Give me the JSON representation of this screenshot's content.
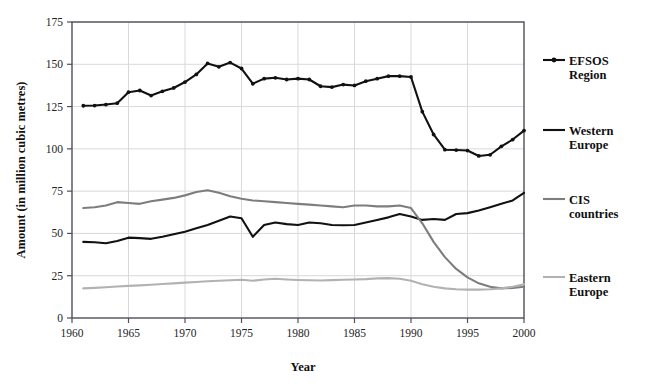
{
  "chart_data": {
    "type": "line",
    "title": "",
    "xlabel": "Year",
    "ylabel": "Amount (in million cubic metres)",
    "xlim": [
      1960,
      2000
    ],
    "ylim": [
      0,
      175
    ],
    "ytick_step": 25,
    "xtick_step": 5,
    "grid": true,
    "grid_axes": "both",
    "legend_position": "right",
    "xticks": [
      1960,
      1965,
      1970,
      1975,
      1980,
      1985,
      1990,
      1995,
      2000
    ],
    "yticks": [
      0,
      25,
      50,
      75,
      100,
      125,
      150,
      175
    ],
    "xtick_labels": [
      "1960",
      "1965",
      "1970",
      "1975",
      "1980",
      "1985",
      "1990",
      "1995",
      "2000"
    ],
    "ytick_labels": [
      "0",
      "25",
      "50",
      "75",
      "100",
      "125",
      "150",
      "175"
    ],
    "x": [
      1961,
      1962,
      1963,
      1964,
      1965,
      1966,
      1967,
      1968,
      1969,
      1970,
      1971,
      1972,
      1973,
      1974,
      1975,
      1976,
      1977,
      1978,
      1979,
      1980,
      1981,
      1982,
      1983,
      1984,
      1985,
      1986,
      1987,
      1988,
      1989,
      1990,
      1991,
      1992,
      1993,
      1994,
      1995,
      1996,
      1997,
      1998,
      1999,
      2000
    ],
    "series": [
      {
        "name": "EFSOS Region",
        "color": "#111111",
        "width": 2.1,
        "markers": true,
        "values": [
          125.5,
          125.6,
          126.2,
          127.0,
          133.5,
          134.5,
          131.5,
          134.0,
          136.0,
          139.5,
          144.0,
          150.5,
          148.5,
          151.0,
          147.5,
          138.5,
          141.5,
          142.0,
          141.0,
          141.5,
          141.0,
          137.0,
          136.5,
          138.0,
          137.5,
          140.0,
          141.5,
          143.0,
          143.0,
          142.5,
          122.0,
          108.5,
          99.5,
          99.3,
          99.0,
          95.8,
          96.5,
          101.5,
          105.5,
          110.8
        ]
      },
      {
        "name": "Western Europe",
        "color": "#111111",
        "width": 2.1,
        "markers": false,
        "values": [
          45.0,
          44.8,
          44.2,
          45.5,
          47.5,
          47.2,
          46.8,
          48.0,
          49.5,
          51.0,
          53.0,
          55.0,
          57.5,
          60.0,
          59.0,
          48.0,
          55.0,
          56.5,
          55.5,
          55.0,
          56.5,
          56.0,
          55.0,
          54.8,
          55.0,
          56.5,
          58.0,
          59.5,
          61.5,
          60.0,
          58.0,
          58.5,
          58.0,
          61.5,
          62.0,
          63.5,
          65.5,
          67.5,
          69.5,
          74.0
        ]
      },
      {
        "name": "CIS countries",
        "color": "#7d7d7d",
        "width": 2.1,
        "markers": false,
        "values": [
          65.0,
          65.5,
          66.5,
          68.5,
          68.0,
          67.5,
          69.0,
          70.0,
          71.0,
          72.5,
          74.5,
          75.5,
          74.0,
          72.0,
          70.5,
          69.5,
          69.0,
          68.5,
          68.0,
          67.5,
          67.0,
          66.5,
          66.0,
          65.5,
          66.5,
          66.5,
          66.0,
          66.0,
          66.5,
          65.0,
          56.0,
          45.0,
          36.0,
          29.0,
          24.0,
          20.5,
          18.5,
          17.5,
          17.8,
          18.5
        ]
      },
      {
        "name": "Eastern Europe",
        "color": "#b2b2b2",
        "width": 2.1,
        "markers": false,
        "values": [
          17.5,
          17.8,
          18.2,
          18.6,
          19.0,
          19.3,
          19.7,
          20.1,
          20.5,
          20.9,
          21.3,
          21.7,
          22.0,
          22.3,
          22.6,
          22.0,
          22.8,
          23.2,
          22.8,
          22.5,
          22.3,
          22.2,
          22.4,
          22.6,
          22.8,
          23.0,
          23.4,
          23.6,
          23.2,
          22.0,
          20.0,
          18.5,
          17.5,
          17.0,
          16.8,
          16.8,
          17.0,
          17.5,
          18.5,
          20.0
        ]
      }
    ]
  },
  "legend": {
    "entries": [
      {
        "label_line1": "EFSOS",
        "label_line2": "Region",
        "swatch": "line-with-marker",
        "color": "#111111"
      },
      {
        "label_line1": "Western",
        "label_line2": "Europe",
        "swatch": "line",
        "color": "#111111"
      },
      {
        "label_line1": "CIS",
        "label_line2": "countries",
        "swatch": "line",
        "color": "#7d7d7d"
      },
      {
        "label_line1": "Eastern",
        "label_line2": "Europe",
        "swatch": "line",
        "color": "#b2b2b2"
      }
    ]
  },
  "axes": {
    "x_title": "Year",
    "y_title": "Amount (in million cubic metres)"
  },
  "style": {
    "background": "#ffffff",
    "frame_color": "#4f4f58",
    "grid_color": "#d9d9d9",
    "text_color": "#232323"
  }
}
